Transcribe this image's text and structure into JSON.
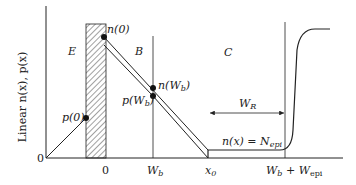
{
  "axis": {
    "y_label": "Linear n(x), p(x)",
    "origin_label": "0"
  },
  "regions": {
    "emitter": "E",
    "base": "B",
    "collector": "C"
  },
  "x_ticks": {
    "zero": "0",
    "wb": "W",
    "wb_sub": "b",
    "x0": "x",
    "x0_sub": "0",
    "wbepi_w1": "W",
    "wbepi_sub1": "b",
    "wbepi_plus": " + ",
    "wbepi_w2": "W",
    "wbepi_sub2": "epi"
  },
  "points": {
    "n0": "n(0)",
    "p0": "p(0)",
    "nwb_pre": "n(W",
    "nwb_sub": "b",
    "nwb_post": ")",
    "pwb_pre": "p(W",
    "pwb_sub": "b",
    "pwb_post": ")"
  },
  "annotations": {
    "wr": "W",
    "wr_sub": "R",
    "nepi_pre": "n(x) = N",
    "nepi_sub": "epi"
  },
  "colors": {
    "line": "#222222",
    "hatch": "#444444"
  }
}
